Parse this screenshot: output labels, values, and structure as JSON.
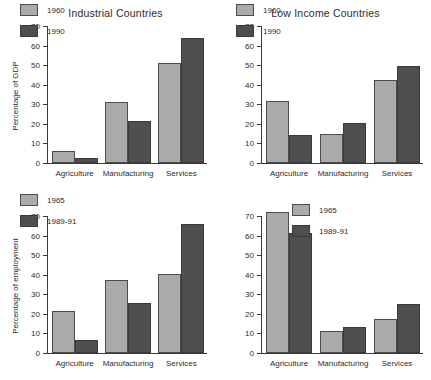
{
  "chart_data": [
    {
      "id": "industrial-gdp",
      "type": "bar",
      "title": "Industrial Countries",
      "xlabel": "",
      "ylabel": "Percentage of GDP",
      "ylim": [
        0,
        70
      ],
      "yticks": [
        0,
        10,
        20,
        30,
        40,
        50,
        60,
        70
      ],
      "grid": false,
      "legend_position": "upper-left-inside",
      "categories": [
        "Agriculture",
        "Manufacturing",
        "Services"
      ],
      "series": [
        {
          "name": "1960",
          "color": "#aaaaaa",
          "values": [
            6,
            31,
            51
          ]
        },
        {
          "name": "1990",
          "color": "#4f4f4f",
          "values": [
            2.5,
            21.5,
            64
          ]
        }
      ]
    },
    {
      "id": "lowincome-gdp",
      "type": "bar",
      "title": "Low Income Countries",
      "xlabel": "",
      "ylabel": "",
      "ylim": [
        0,
        70
      ],
      "yticks": [
        0,
        10,
        20,
        30,
        40,
        50,
        60,
        70
      ],
      "grid": false,
      "legend_position": "upper-left-inside",
      "categories": [
        "Agriculture",
        "Manufacturing",
        "Services"
      ],
      "series": [
        {
          "name": "1960",
          "color": "#aaaaaa",
          "values": [
            31.5,
            15,
            42.5
          ]
        },
        {
          "name": "1990",
          "color": "#4f4f4f",
          "values": [
            14.5,
            20.5,
            49.5
          ]
        }
      ]
    },
    {
      "id": "industrial-employment",
      "type": "bar",
      "title": "",
      "xlabel": "",
      "ylabel": "Percentage of employment",
      "ylim": [
        0,
        70
      ],
      "yticks": [
        0,
        10,
        20,
        30,
        40,
        50,
        60,
        70
      ],
      "grid": false,
      "legend_position": "upper-left-inside",
      "categories": [
        "Agriculture",
        "Manufacturing",
        "Services"
      ],
      "series": [
        {
          "name": "1965",
          "color": "#aaaaaa",
          "values": [
            21.7,
            37.5,
            40.3
          ]
        },
        {
          "name": "1989-91",
          "color": "#4f4f4f",
          "values": [
            6.8,
            25.5,
            66
          ]
        }
      ]
    },
    {
      "id": "lowincome-employment",
      "type": "bar",
      "title": "",
      "xlabel": "",
      "ylabel": "",
      "ylim": [
        0,
        70
      ],
      "yticks": [
        0,
        10,
        20,
        30,
        40,
        50,
        60,
        70
      ],
      "grid": false,
      "legend_position": "center-right-inside",
      "categories": [
        "Agriculture",
        "Manufacturing",
        "Services"
      ],
      "series": [
        {
          "name": "1965",
          "color": "#aaaaaa",
          "values": [
            72,
            11,
            17.3
          ]
        },
        {
          "name": "1989-91",
          "color": "#4f4f4f",
          "values": [
            61.5,
            13.3,
            24.8
          ]
        }
      ]
    }
  ]
}
